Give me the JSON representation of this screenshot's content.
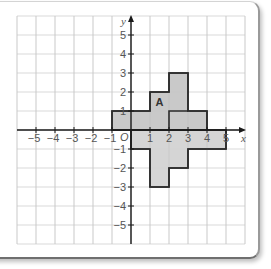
{
  "diagram": {
    "type": "coordinate-grid",
    "x_range": [
      -6,
      6
    ],
    "y_range": [
      -6,
      6
    ],
    "axis_labels": {
      "x": "x",
      "y": "y",
      "origin": "O"
    },
    "x_ticks": [
      {
        "value": -5,
        "label": "−5"
      },
      {
        "value": -4,
        "label": "−4"
      },
      {
        "value": -3,
        "label": "−3"
      },
      {
        "value": -2,
        "label": "−2"
      },
      {
        "value": -1,
        "label": "−1"
      },
      {
        "value": 1,
        "label": "1"
      },
      {
        "value": 2,
        "label": "2"
      },
      {
        "value": 3,
        "label": "3"
      },
      {
        "value": 4,
        "label": "4"
      },
      {
        "value": 5,
        "label": "5"
      }
    ],
    "y_ticks": [
      {
        "value": 5,
        "label": "5"
      },
      {
        "value": 4,
        "label": "4"
      },
      {
        "value": 3,
        "label": "3"
      },
      {
        "value": 2,
        "label": "2"
      },
      {
        "value": 1,
        "label": "1"
      },
      {
        "value": -1,
        "label": "−1"
      },
      {
        "value": -2,
        "label": "−2"
      },
      {
        "value": -3,
        "label": "−3"
      },
      {
        "value": -4,
        "label": "−4"
      },
      {
        "value": -5,
        "label": "−5"
      }
    ],
    "shapes": [
      {
        "name": "A",
        "label": "A",
        "label_at": [
          1.5,
          1.5
        ],
        "fill": "#c6c6c6",
        "points": [
          [
            -1,
            0
          ],
          [
            -1,
            1
          ],
          [
            1,
            1
          ],
          [
            1,
            2
          ],
          [
            2,
            2
          ],
          [
            2,
            3
          ],
          [
            3,
            3
          ],
          [
            3,
            1
          ],
          [
            4,
            1
          ],
          [
            4,
            0
          ]
        ],
        "inner_lines": [
          [
            [
              2,
              0
            ],
            [
              2,
              1
            ],
            [
              3,
              1
            ]
          ]
        ]
      },
      {
        "name": "image",
        "label": "",
        "fill": "#d3d3d3",
        "points": [
          [
            0,
            0
          ],
          [
            5,
            0
          ],
          [
            5,
            -1
          ],
          [
            3,
            -1
          ],
          [
            3,
            -2
          ],
          [
            2,
            -2
          ],
          [
            2,
            -3
          ],
          [
            1,
            -3
          ],
          [
            1,
            -1
          ],
          [
            0,
            -1
          ]
        ],
        "inner_lines": []
      }
    ],
    "colors": {
      "grid": "#cfcfcf",
      "axis": "#1a1a1a",
      "outline": "#2a2a2a",
      "text": "#555555"
    }
  }
}
